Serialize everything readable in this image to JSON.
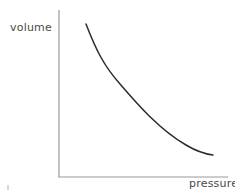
{
  "figure": {
    "background_color": "#ffffff",
    "width": 235,
    "height": 194
  },
  "chart_data": {
    "type": "line",
    "title": "",
    "subtitle": "",
    "xlabel": "pressure",
    "ylabel": "volume",
    "grid": false,
    "legend": null,
    "axis_ticks": {
      "x": [],
      "y": []
    },
    "axis_color": "#9a9a9a",
    "curve_color": "#2b2b2b",
    "curve_width": 1.5,
    "relationship": "inverse",
    "x": [
      0.16,
      0.21,
      0.27,
      0.33,
      0.4,
      0.47,
      0.55,
      0.63,
      0.72,
      0.81,
      0.91,
      1.0
    ],
    "y": [
      0.92,
      0.76,
      0.62,
      0.52,
      0.44,
      0.37,
      0.31,
      0.27,
      0.23,
      0.2,
      0.17,
      0.15
    ],
    "xlim": [
      0,
      1
    ],
    "ylim": [
      0,
      1
    ],
    "points_px": [
      [
        86,
        24
      ],
      [
        94,
        40
      ],
      [
        102,
        55
      ],
      [
        111,
        70
      ],
      [
        120,
        84
      ],
      [
        131,
        98
      ],
      [
        142,
        111
      ],
      [
        154,
        124
      ],
      [
        167,
        135
      ],
      [
        181,
        144
      ],
      [
        197,
        151
      ],
      [
        213,
        155
      ]
    ],
    "path_d": "M 86 24 C 96 50 104 66 120 84 C 138 105 160 130 186 145 C 196 151 205 154 213 155"
  },
  "axes": {
    "y_axis": {
      "x": 59,
      "y_top": 10,
      "y_bottom": 177
    },
    "x_axis": {
      "y": 177,
      "x_left": 59,
      "x_right": 228
    }
  },
  "artifact": {
    "label": "stray-mark"
  }
}
